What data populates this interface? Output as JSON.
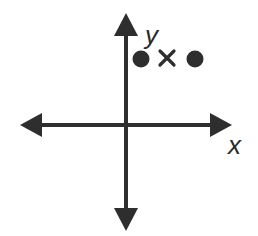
{
  "diagram": {
    "type": "coordinate-plane",
    "colors": {
      "stroke": "#2e2e2e",
      "background": "#ffffff"
    },
    "axes": {
      "x_label": "x",
      "y_label": "y"
    },
    "points": [
      {
        "marker": "dot",
        "quadrant": "I",
        "position": "left"
      },
      {
        "marker": "x",
        "quadrant": "I",
        "position": "middle"
      },
      {
        "marker": "dot",
        "quadrant": "I",
        "position": "right"
      }
    ]
  }
}
